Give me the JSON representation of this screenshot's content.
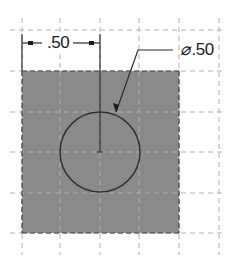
{
  "drawing": {
    "dimension_linear": ".50",
    "dimension_diameter_symbol": "⌀",
    "dimension_diameter_value": ".50",
    "colors": {
      "fill": "#8a8a8a",
      "grid": "#b5b5b5",
      "line": "#2a2a2a"
    }
  }
}
